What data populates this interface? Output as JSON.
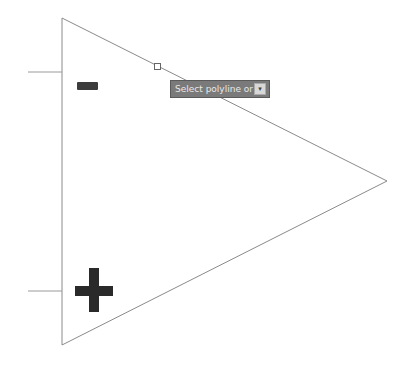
{
  "drawing": {
    "shape": "op-amp-triangle",
    "stroke_color": "#8a8a8a",
    "vertices": {
      "top": [
        62,
        18
      ],
      "right": [
        387,
        181
      ],
      "bottom": [
        62,
        345
      ]
    },
    "inputs": [
      {
        "name": "inverting",
        "y": 72,
        "x_from": 28,
        "x_to": 62,
        "symbol": "minus"
      },
      {
        "name": "non-inverting",
        "y": 291,
        "x_from": 28,
        "x_to": 62,
        "symbol": "plus"
      }
    ],
    "grip": {
      "x": 157,
      "y": 66
    }
  },
  "tooltip": {
    "text": "Select polyline or",
    "arrow_icon": "▾",
    "background": "#7a7a7a"
  }
}
